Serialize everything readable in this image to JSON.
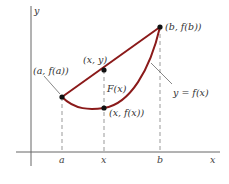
{
  "diagram": {
    "axes": {
      "x_label": "x",
      "y_label": "y"
    },
    "ticks": {
      "a": "a",
      "x": "x",
      "b": "b"
    },
    "points": {
      "start": "(a, f(a))",
      "chord_point": "(x, y)",
      "curve_point": "(x, f(x))",
      "end": "(b, f(b))"
    },
    "labels": {
      "gap": "F(x)",
      "curve": "y = f(x)"
    },
    "colors": {
      "curve": "#8b1a1a",
      "axes": "#555555",
      "dashes": "#999999",
      "points": "#111111"
    }
  }
}
